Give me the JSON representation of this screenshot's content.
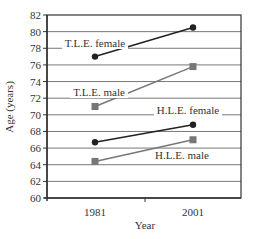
{
  "chart_data": {
    "type": "line",
    "title": "",
    "xlabel": "Year",
    "ylabel": "Age (years)",
    "categories": [
      "1981",
      "2001"
    ],
    "x": [
      1981,
      2001
    ],
    "ylim": [
      60,
      82
    ],
    "yticks": [
      60,
      62,
      64,
      66,
      68,
      70,
      72,
      74,
      76,
      78,
      80,
      82
    ],
    "grid": true,
    "legend": "inline labels",
    "series": [
      {
        "name": "T.L.E. female",
        "values": [
          77.0,
          80.5
        ],
        "marker": "circle",
        "color": "#222222"
      },
      {
        "name": "T.L.E. male",
        "values": [
          71.0,
          75.8
        ],
        "marker": "square",
        "color": "#777777"
      },
      {
        "name": "H.L.E. female",
        "values": [
          66.7,
          68.8
        ],
        "marker": "circle",
        "color": "#222222"
      },
      {
        "name": "H.L.E. male",
        "values": [
          64.4,
          67.0
        ],
        "marker": "square",
        "color": "#777777"
      }
    ]
  },
  "labels": {
    "xlabel": "Year",
    "ylabel": "Age (years)",
    "x_ticks": [
      "1981",
      "2001"
    ],
    "tle_female": "T.L.E. female",
    "tle_male": "T.L.E. male",
    "hle_female": "H.L.E. female",
    "hle_male": "H.L.E. male"
  }
}
